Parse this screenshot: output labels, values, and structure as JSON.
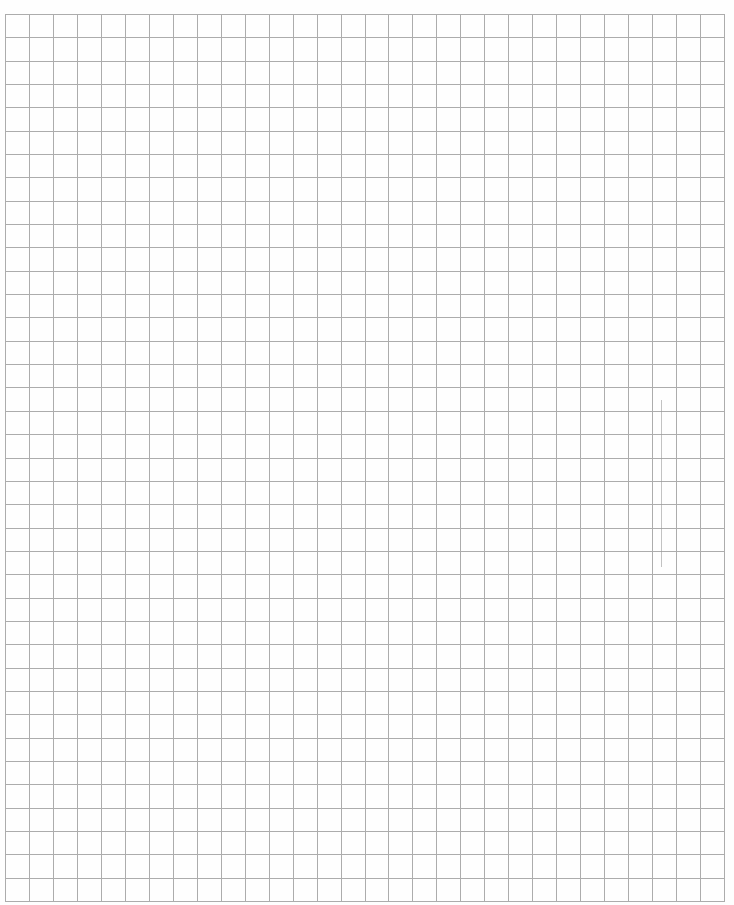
{
  "document": {
    "type": "graph-paper",
    "page_number_fragment": "",
    "grid": {
      "left": 5,
      "top": 14,
      "right": 724,
      "bottom": 901,
      "columns": 30,
      "rows": 38,
      "line_color": "#acacac",
      "background_color": "#fefefe"
    },
    "marks": [
      {
        "type": "faint-pencil-line",
        "x": 661,
        "y1": 400,
        "y2": 567,
        "color": "#9a9a9a"
      }
    ]
  }
}
